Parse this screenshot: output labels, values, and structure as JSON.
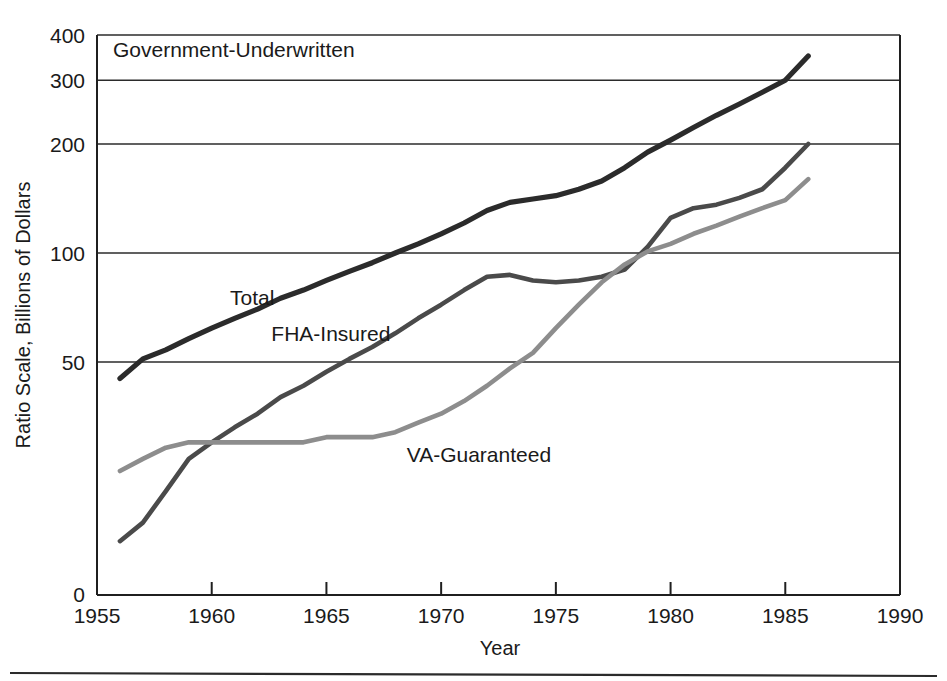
{
  "figure": {
    "panel_title": "Government-Underwritten",
    "footer_rule": true
  },
  "chart_data": {
    "type": "line",
    "title": "Government-Underwritten",
    "xlabel": "Year",
    "ylabel": "Ratio Scale, Billions of Dollars",
    "scale": "log",
    "grid": true,
    "legend_position": "inline-labels",
    "xlim": [
      1955,
      1990
    ],
    "ylim": [
      10,
      400
    ],
    "xticks": [
      1955,
      1960,
      1965,
      1970,
      1975,
      1980,
      1985,
      1990
    ],
    "yticks": [
      50,
      100,
      200,
      300,
      400
    ],
    "ytick_labels": [
      "50",
      "100",
      "200",
      "300",
      "400"
    ],
    "y_zero_label": "0",
    "gridlines": [
      50,
      100,
      200,
      300,
      400
    ],
    "x": [
      1956,
      1957,
      1958,
      1959,
      1960,
      1961,
      1962,
      1963,
      1964,
      1965,
      1966,
      1967,
      1968,
      1969,
      1970,
      1971,
      1972,
      1973,
      1974,
      1975,
      1976,
      1977,
      1978,
      1979,
      1980,
      1981,
      1982,
      1983,
      1984,
      1985,
      1986
    ],
    "series": [
      {
        "name": "Total",
        "label": "Total",
        "color": "#2b2b2b",
        "width": 5.2,
        "label_x": 1960.8,
        "label_y": 72,
        "values": [
          45,
          51,
          54,
          58,
          62,
          66,
          70,
          75,
          79,
          84,
          89,
          94,
          100,
          106,
          113,
          121,
          131,
          138,
          141,
          144,
          150,
          158,
          172,
          190,
          205,
          222,
          240,
          258,
          278,
          300,
          350
        ]
      },
      {
        "name": "FHA-Insured",
        "label": "FHA-Insured",
        "color": "#4a4a4a",
        "width": 4.6,
        "label_x": 1962.6,
        "label_y": 57,
        "values": [
          16,
          18,
          22,
          27,
          30,
          33,
          36,
          40,
          43,
          47,
          51,
          55,
          60,
          66,
          72,
          79,
          86,
          87,
          84,
          83,
          84,
          86,
          90,
          104,
          125,
          133,
          136,
          142,
          150,
          172,
          200
        ]
      },
      {
        "name": "VA-Guaranteed",
        "label": "VA-Guaranteed",
        "color": "#8d8d8d",
        "width": 4.6,
        "label_x": 1968.5,
        "label_y": 26.5,
        "values": [
          25,
          27,
          29,
          30,
          30,
          30,
          30,
          30,
          30,
          31,
          31,
          31,
          32,
          34,
          36,
          39,
          43,
          48,
          53,
          62,
          72,
          83,
          93,
          101,
          106,
          113,
          119,
          126,
          133,
          140,
          160
        ]
      }
    ]
  }
}
